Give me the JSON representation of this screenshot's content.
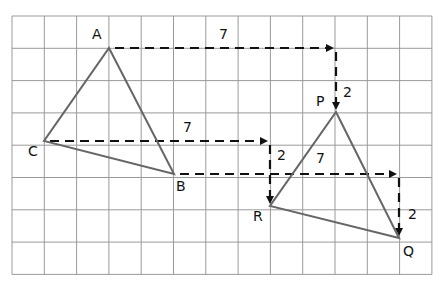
{
  "grid": {
    "left": 12,
    "top": 16,
    "cell": 32.3,
    "cols": 13,
    "rows": 8,
    "line_color": "#9a9a9a"
  },
  "triangle_color": "#666666",
  "arrow_color": "#111111",
  "original_triangle": {
    "points": [
      {
        "label": "A",
        "x": 109,
        "y": 48,
        "lx": 92,
        "ly": 28
      },
      {
        "label": "B",
        "x": 174,
        "y": 174,
        "lx": 176,
        "ly": 178
      },
      {
        "label": "C",
        "x": 44,
        "y": 141,
        "lx": 28,
        "ly": 143
      }
    ]
  },
  "image_triangle": {
    "points": [
      {
        "label": "P",
        "x": 336,
        "y": 112,
        "lx": 316,
        "ly": 94
      },
      {
        "label": "Q",
        "x": 399,
        "y": 238,
        "lx": 403,
        "ly": 243
      },
      {
        "label": "R",
        "x": 270,
        "y": 206,
        "lx": 253,
        "ly": 208
      }
    ]
  },
  "translations": [
    {
      "from": "A",
      "to": "P",
      "horizontal": "7",
      "vertical": "2",
      "h_label_pos": [
        219,
        26
      ],
      "v_label_pos": [
        343,
        86
      ]
    },
    {
      "from": "C",
      "to": "R",
      "horizontal": "7",
      "vertical": "2",
      "h_label_pos": [
        183,
        120
      ],
      "v_label_pos": [
        276,
        148
      ]
    },
    {
      "from": "B",
      "to": "Q",
      "horizontal": "7",
      "vertical": "2",
      "h_label_pos": [
        316,
        152
      ],
      "v_label_pos": [
        407,
        207
      ]
    }
  ]
}
